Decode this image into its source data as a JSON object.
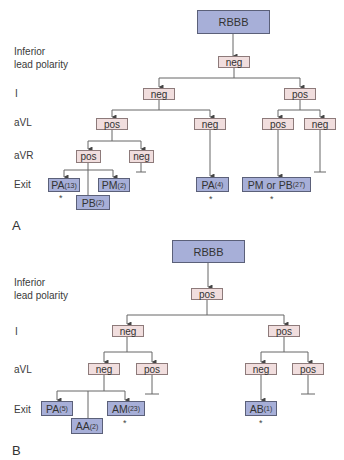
{
  "panel_a": {
    "label": "A",
    "row_labels": {
      "inferior_1": "Inferior",
      "inferior_2": "lead polarity",
      "lead_i": "I",
      "avl": "aVL",
      "avr": "aVR",
      "exit": "Exit"
    },
    "root": "RBBB",
    "inferior": "neg",
    "i_left": "neg",
    "i_right": "pos",
    "avl_1": "pos",
    "avl_2": "neg",
    "avl_3": "pos",
    "avl_4": "neg",
    "avr_1": "pos",
    "avr_2": "neg",
    "exits": [
      {
        "name": "PA",
        "count": "(13)",
        "star": "*"
      },
      {
        "name": "PB",
        "count": "(2)",
        "star": ""
      },
      {
        "name": "PM",
        "count": "(2)",
        "star": ""
      },
      {
        "name": "PA",
        "count": "(4)",
        "star": "*"
      },
      {
        "name": "PM or PB",
        "count": "(27)",
        "star": "*"
      }
    ]
  },
  "panel_b": {
    "label": "B",
    "row_labels": {
      "inferior_1": "Inferior",
      "inferior_2": "lead polarity",
      "lead_i": "I",
      "avl": "aVL",
      "exit": "Exit"
    },
    "root": "RBBB",
    "inferior": "pos",
    "i_left": "neg",
    "i_right": "pos",
    "avl_1": "neg",
    "avl_2": "pos",
    "avl_3": "neg",
    "avl_4": "pos",
    "exits": [
      {
        "name": "PA",
        "count": "(5)",
        "star": ""
      },
      {
        "name": "AA",
        "count": "(2)",
        "star": ""
      },
      {
        "name": "AM",
        "count": "(23)",
        "star": "*"
      },
      {
        "name": "AB",
        "count": "(1)",
        "star": "*"
      }
    ]
  },
  "colors": {
    "exit_box_fill": "#a7afd8",
    "exit_box_border": "#5b6079",
    "polarity_box_fill": "#f1dede",
    "polarity_box_border": "#8d7a7a",
    "line": "#555555"
  }
}
